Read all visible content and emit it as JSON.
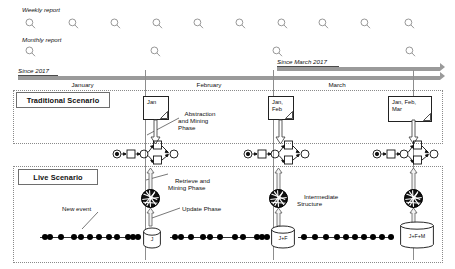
{
  "figure": {
    "title_weekly": "Weekly report",
    "title_monthly": "Monthly report",
    "since_2017": "Since 2017",
    "since_march_2017": "Since March 2017"
  },
  "timeline": {
    "months": [
      {
        "label": "January",
        "x": 20,
        "w": 125
      },
      {
        "label": "February",
        "x": 145,
        "w": 128
      },
      {
        "label": "March",
        "x": 273,
        "w": 128
      }
    ],
    "weekly_icon_x": [
      25,
      68,
      110,
      152,
      193,
      235,
      277,
      318,
      360,
      404
    ],
    "monthly_icon_x": [
      25,
      150,
      272,
      405
    ]
  },
  "traditional": {
    "title": "Traditional Scenario",
    "phase_label": "Abstraction\nand Mining\nPhase",
    "notes": [
      {
        "text": "Jan",
        "x": 143,
        "w": 26,
        "h": 24
      },
      {
        "text": "Jan,\nFeb",
        "x": 268,
        "w": 26,
        "h": 24
      },
      {
        "text": "Jan, Feb,\nMar",
        "x": 388,
        "w": 44,
        "h": 26
      }
    ],
    "petri_x": [
      112,
      243,
      372
    ],
    "petri_label": "petri-net-process-model"
  },
  "live": {
    "title": "Live Scenario",
    "retrieve_label": "Retrieve and\nMining Phase",
    "intermediate_label": "Intermediate\nStructure",
    "update_label": "Update Phase",
    "new_event_label": "New event",
    "blob_x": [
      150,
      278,
      413
    ],
    "stores": [
      {
        "text": "J",
        "x": 143,
        "w": 18,
        "h": 20
      },
      {
        "text": "J+F",
        "x": 271,
        "w": 24,
        "h": 22
      },
      {
        "text": "J+F+M",
        "x": 400,
        "w": 34,
        "h": 26
      }
    ],
    "event_runs": [
      {
        "x": 40,
        "w": 98,
        "dots": [
          2,
          7,
          18,
          31,
          38,
          47,
          56,
          66,
          74,
          85,
          90,
          95
        ]
      },
      {
        "x": 170,
        "w": 96,
        "dots": [
          2,
          8,
          18,
          30,
          37,
          47,
          62,
          70,
          84,
          89,
          94
        ]
      },
      {
        "x": 298,
        "w": 96,
        "dots": [
          3,
          14,
          25,
          36,
          45,
          54,
          63,
          72,
          81,
          90
        ]
      }
    ]
  },
  "colors": {
    "bar_gray": "#9a9a9a",
    "line_dark": "#222222",
    "dash_gray": "#8a8a8a",
    "blob_dark": "#111111"
  }
}
